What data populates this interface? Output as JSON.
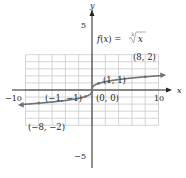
{
  "chart_data": {
    "type": "line",
    "title": "",
    "function_label": "f(x) = ∛x",
    "function_label_parts": {
      "lhs": "f(x) = ",
      "root_index": "3",
      "radicand": "x"
    },
    "xlabel": "x",
    "ylabel": "y",
    "xlim": [
      -10,
      10
    ],
    "ylim": [
      -5,
      5
    ],
    "grid": true,
    "grid_step": 2,
    "x_tick_labels": [
      "−10",
      "10"
    ],
    "y_tick_labels": [
      "5",
      "−5"
    ],
    "series": [
      {
        "name": "f(x) = cube root of x",
        "x": [
          -10,
          -8,
          -1,
          0,
          1,
          8,
          10
        ],
        "y": [
          -2.154,
          -2,
          -1,
          0,
          1,
          2,
          2.154
        ]
      }
    ],
    "points": [
      {
        "x": -8,
        "y": -2,
        "label": "(−8, −2)"
      },
      {
        "x": -1,
        "y": -1,
        "label": "(−1, −1)"
      },
      {
        "x": 0,
        "y": 0,
        "label": "(0, 0)"
      },
      {
        "x": 1,
        "y": 1,
        "label": "(1, 1)"
      },
      {
        "x": 8,
        "y": 2,
        "label": "(8, 2)"
      }
    ]
  },
  "colors": {
    "curve": "#6f7278",
    "grid": "#c9c9c9",
    "axis": "#222222",
    "label": "#222222",
    "function_label": "#9a9a9a"
  }
}
